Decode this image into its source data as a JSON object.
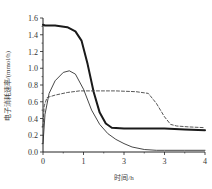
{
  "chart_data": {
    "type": "line",
    "title": "",
    "xlabel": "时间/h",
    "ylabel": "电子消耗速率/(mmol/h)",
    "xlim": [
      0,
      4
    ],
    "ylim": [
      0,
      1.6
    ],
    "x_tick_labels": [
      "0",
      "1",
      "3",
      "3",
      "4"
    ],
    "x_tick_values": [
      0,
      1,
      2,
      3,
      4
    ],
    "y_tick_labels": [
      "0.0",
      "0.2",
      "0.4",
      "0.6",
      "0.8",
      "1.0",
      "1.2",
      "1.4",
      "1.6"
    ],
    "y_tick_values": [
      0,
      0.2,
      0.4,
      0.6,
      0.8,
      1.0,
      1.2,
      1.4,
      1.6
    ],
    "grid": false,
    "legend": null,
    "series": [
      {
        "name": "thick-solid",
        "style": "solid-thick",
        "color": "#1a1a1a",
        "x": [
          0,
          0.05,
          0.3,
          0.6,
          0.8,
          0.95,
          1.1,
          1.25,
          1.4,
          1.55,
          1.7,
          2.0,
          2.5,
          3.0,
          3.5,
          4.0
        ],
        "y": [
          1.52,
          1.51,
          1.51,
          1.49,
          1.44,
          1.33,
          1.05,
          0.72,
          0.47,
          0.34,
          0.29,
          0.28,
          0.28,
          0.28,
          0.27,
          0.26
        ]
      },
      {
        "name": "thin-solid",
        "style": "solid-thin",
        "color": "#333333",
        "x": [
          0,
          0.05,
          0.15,
          0.3,
          0.5,
          0.65,
          0.8,
          1.0,
          1.2,
          1.4,
          1.6,
          1.8,
          2.0,
          2.2,
          2.5,
          2.8,
          3.0,
          3.5,
          4.0
        ],
        "y": [
          0.1,
          0.45,
          0.7,
          0.85,
          0.95,
          0.97,
          0.93,
          0.75,
          0.5,
          0.33,
          0.22,
          0.15,
          0.1,
          0.06,
          0.03,
          0.02,
          0.02,
          0.02,
          0.02
        ]
      },
      {
        "name": "dashed",
        "style": "dashed",
        "color": "#444444",
        "x": [
          0,
          0.03,
          0.1,
          0.3,
          0.6,
          0.9,
          1.3,
          1.8,
          2.3,
          2.6,
          2.8,
          3.0,
          3.15,
          3.3,
          3.6,
          4.0
        ],
        "y": [
          0.3,
          0.55,
          0.65,
          0.68,
          0.71,
          0.73,
          0.73,
          0.73,
          0.72,
          0.7,
          0.58,
          0.42,
          0.33,
          0.31,
          0.3,
          0.29
        ]
      }
    ]
  }
}
